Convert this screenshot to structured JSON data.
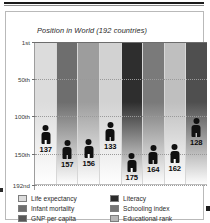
{
  "chart_title": "Position in World (192 countries)",
  "legend": {
    "left_column": [
      {
        "label": "Life expectancy",
        "color": "#dcdcdc",
        "icon": "legend-swatch-icon"
      },
      {
        "label": "Infant mortality",
        "color": "#6e6e6e",
        "icon": "legend-swatch-icon"
      },
      {
        "label": "GNP per capita",
        "color": "#585858",
        "icon": "legend-swatch-icon"
      },
      {
        "label": "Daily calorie intake",
        "color": "#cfcfcf",
        "icon": "legend-swatch-icon"
      }
    ],
    "right_column": [
      {
        "label": "Literacy",
        "color": "#2b2b2b",
        "icon": "legend-swatch-icon"
      },
      {
        "label": "Schooling index",
        "color": "#767676",
        "icon": "legend-swatch-icon"
      },
      {
        "label": "Educational rank",
        "color": "#b7b7b7",
        "icon": "legend-swatch-icon"
      },
      {
        "label": "Human dev. index",
        "color": "#4d4d4d",
        "icon": "legend-swatch-icon"
      }
    ]
  },
  "chart_data": {
    "type": "bar",
    "title": "Position in World (192 countries)",
    "xlabel": "",
    "ylabel": "Position in World",
    "ylim": [
      1,
      192
    ],
    "y_inverted": true,
    "grid": true,
    "legend_position": "bottom",
    "ytick_labels": [
      "1st",
      "50th",
      "100th",
      "150th",
      "192nd"
    ],
    "ytick_values": [
      1,
      50,
      100,
      150,
      192
    ],
    "categories": [
      "Life expectancy",
      "Infant mortality",
      "GNP per capita",
      "Daily calorie intake",
      "Literacy",
      "Schooling index",
      "Educational rank",
      "Human dev. index"
    ],
    "values": [
      137,
      157,
      156,
      133,
      175,
      164,
      162,
      128
    ],
    "value_labels": [
      "137",
      "157",
      "156",
      "133",
      "175",
      "164",
      "162",
      "128"
    ],
    "column_colors": [
      "#dcdcdc",
      "#6e6e6e",
      "#9d9d9d",
      "#d2d2d2",
      "#2e2e2e",
      "#7a7a7a",
      "#bfbfbf",
      "#4f4f4f"
    ],
    "marker": "human-figure-icon"
  }
}
